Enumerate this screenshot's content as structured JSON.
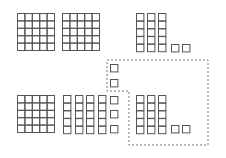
{
  "diagram": {
    "stroke_color": "#555555",
    "dash_color": "#777777",
    "background": "#ffffff",
    "cell_size": 7.4,
    "top_row": {
      "hundreds": [
        {
          "x": 17,
          "y": 13
        },
        {
          "x": 62,
          "y": 13
        }
      ],
      "tens": [
        {
          "x": 136,
          "y": 13
        },
        {
          "x": 147,
          "y": 13
        },
        {
          "x": 158,
          "y": 13
        }
      ],
      "ones": [
        {
          "x": 171,
          "y": 44
        },
        {
          "x": 182,
          "y": 44
        }
      ]
    },
    "bottom_row": {
      "hundreds": [
        {
          "x": 17,
          "y": 95
        }
      ],
      "tens": [
        {
          "x": 63,
          "y": 95
        },
        {
          "x": 75,
          "y": 95
        },
        {
          "x": 86,
          "y": 95
        },
        {
          "x": 98,
          "y": 95
        }
      ],
      "tens_broken_ones": [
        {
          "x": 110,
          "y": 96
        },
        {
          "x": 110,
          "y": 110
        },
        {
          "x": 110,
          "y": 125
        }
      ],
      "highlight_tens": [
        {
          "x": 136,
          "y": 95
        },
        {
          "x": 147,
          "y": 95
        },
        {
          "x": 158,
          "y": 95
        }
      ],
      "highlight_ones": [
        {
          "x": 171,
          "y": 125
        },
        {
          "x": 182,
          "y": 125
        }
      ]
    },
    "highlight_region": {
      "outline_points": "107,60 208,60 208,145 129,145 129,91 107,91",
      "extra_ones": [
        {
          "x": 110,
          "y": 64
        },
        {
          "x": 110,
          "y": 79
        }
      ]
    }
  }
}
